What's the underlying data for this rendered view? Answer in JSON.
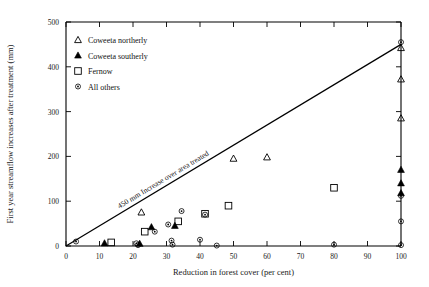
{
  "chart_data": {
    "type": "scatter",
    "title": "",
    "xlabel": "Reduction in forest cover (per cent)",
    "ylabel": "First year streamflow increases after treatment (mm)",
    "xlim": [
      0,
      100
    ],
    "ylim": [
      0,
      500
    ],
    "xticks": [
      0,
      10,
      20,
      30,
      40,
      50,
      60,
      70,
      80,
      90,
      100
    ],
    "yticks": [
      0,
      100,
      200,
      300,
      400,
      500
    ],
    "grid": false,
    "legend_position": "upper-left",
    "annotation": {
      "text": "450 mm  Increase over area treated",
      "line": {
        "x0": 0,
        "y0": 0,
        "x1": 100,
        "y1": 450
      }
    },
    "series": [
      {
        "name": "Coweeta northerly",
        "marker": "open-triangle",
        "points": [
          {
            "x": 22.5,
            "y": 75
          },
          {
            "x": 50,
            "y": 195
          },
          {
            "x": 60,
            "y": 198
          },
          {
            "x": 100,
            "y": 442
          },
          {
            "x": 100,
            "y": 372
          },
          {
            "x": 100,
            "y": 285
          }
        ]
      },
      {
        "name": "Coweeta southerly",
        "marker": "filled-triangle",
        "points": [
          {
            "x": 11.5,
            "y": 6
          },
          {
            "x": 22,
            "y": 5
          },
          {
            "x": 25.5,
            "y": 42
          },
          {
            "x": 32.5,
            "y": 45
          },
          {
            "x": 100,
            "y": 170
          },
          {
            "x": 100,
            "y": 140
          },
          {
            "x": 100,
            "y": 118
          }
        ]
      },
      {
        "name": "Fernow",
        "marker": "open-square",
        "points": [
          {
            "x": 13.5,
            "y": 8
          },
          {
            "x": 23.5,
            "y": 32
          },
          {
            "x": 33.5,
            "y": 55
          },
          {
            "x": 41.5,
            "y": 72
          },
          {
            "x": 48.5,
            "y": 90
          },
          {
            "x": 80,
            "y": 130
          }
        ]
      },
      {
        "name": "All others",
        "marker": "small-circle",
        "points": [
          {
            "x": 3,
            "y": 10
          },
          {
            "x": 21,
            "y": 6
          },
          {
            "x": 21.5,
            "y": 2
          },
          {
            "x": 26.5,
            "y": 32
          },
          {
            "x": 30.5,
            "y": 48
          },
          {
            "x": 31.5,
            "y": 12
          },
          {
            "x": 31.8,
            "y": 3
          },
          {
            "x": 34.5,
            "y": 78
          },
          {
            "x": 40,
            "y": 14
          },
          {
            "x": 41.5,
            "y": 70
          },
          {
            "x": 45,
            "y": 1
          },
          {
            "x": 80,
            "y": 3
          },
          {
            "x": 100,
            "y": 455
          },
          {
            "x": 100,
            "y": 112
          },
          {
            "x": 100,
            "y": 55
          },
          {
            "x": 100,
            "y": 2
          }
        ]
      }
    ],
    "legend": [
      {
        "label": "Coweeta  northerly",
        "marker": "open-triangle"
      },
      {
        "label": "Coweeta southerly",
        "marker": "filled-triangle"
      },
      {
        "label": "Fernow",
        "marker": "open-square"
      },
      {
        "label": "All others",
        "marker": "small-circle"
      }
    ]
  }
}
